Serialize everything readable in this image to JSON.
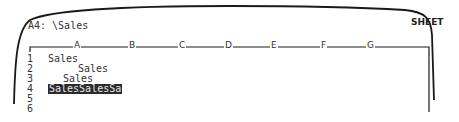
{
  "screen": {
    "cell_indicator": "A4: \\Sales",
    "mode_indicator": "SHEET"
  },
  "worksheet": {
    "columns": [
      "A",
      "B",
      "C",
      "D",
      "E",
      "F",
      "G"
    ],
    "rows": [
      "1",
      "2",
      "3",
      "4",
      "5",
      "6"
    ],
    "cells": [
      {
        "ref": "A1",
        "value": "Sales",
        "align": "left"
      },
      {
        "ref": "A2",
        "value": "Sales",
        "align": "right"
      },
      {
        "ref": "A3",
        "value": "Sales",
        "align": "center"
      },
      {
        "ref": "A4",
        "value": "SalesSalesSa",
        "align": "fill",
        "selected": true
      }
    ]
  }
}
